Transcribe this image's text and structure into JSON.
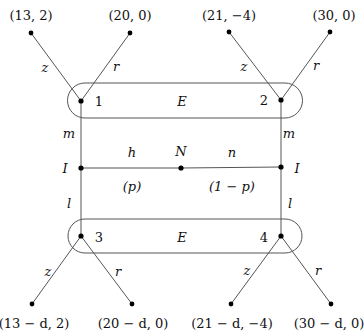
{
  "diagram": {
    "type": "game-tree",
    "colors": {
      "line": "#555555",
      "node": "#000000",
      "text": "#111111",
      "background": "#ffffff"
    },
    "payoffs_top": [
      {
        "label": "(13, 2)",
        "x": 31,
        "y": 33
      },
      {
        "label": "(20, 0)",
        "x": 130,
        "y": 33
      },
      {
        "label": "(21, −4)",
        "x": 229,
        "y": 32
      },
      {
        "label": "(30, 0)",
        "x": 330,
        "y": 32
      }
    ],
    "payoffs_bottom": [
      {
        "label": "(13 − d, 2)",
        "x": 32,
        "y": 304
      },
      {
        "label": "(20 − d, 0)",
        "x": 132,
        "y": 304
      },
      {
        "label": "(21 − d, −4)",
        "x": 231,
        "y": 304
      },
      {
        "label": "(30 − d, 0)",
        "x": 331,
        "y": 304
      }
    ],
    "nodes": [
      {
        "id": "1",
        "label": "1",
        "x": 81,
        "y": 101
      },
      {
        "id": "2",
        "label": "2",
        "x": 281,
        "y": 100
      },
      {
        "id": "3",
        "label": "3",
        "x": 81,
        "y": 236
      },
      {
        "id": "4",
        "label": "4",
        "x": 281,
        "y": 236
      },
      {
        "id": "I_left",
        "label": "I",
        "x": 81,
        "y": 168
      },
      {
        "id": "N",
        "label": "N",
        "x": 181,
        "y": 168
      },
      {
        "id": "I_right",
        "label": "I",
        "x": 281,
        "y": 167
      }
    ],
    "info_sets": [
      {
        "label": "E",
        "position": "top"
      },
      {
        "label": "E",
        "position": "bottom"
      }
    ],
    "edge_labels": {
      "z": "z",
      "r": "r",
      "m": "m",
      "l": "l",
      "h": "h",
      "n": "n",
      "p": "(p)",
      "one_minus_p": "(1 − p)"
    }
  }
}
